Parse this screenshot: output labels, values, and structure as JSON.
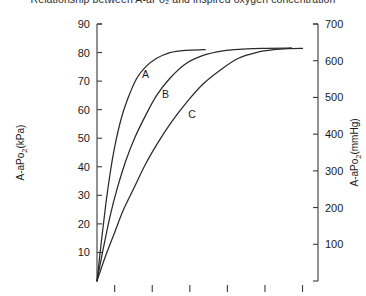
{
  "chart_data": {
    "type": "line",
    "title": "Relationship between A-aPo₂ and inspired oxygen concentration",
    "xlabel": "",
    "ylabel": "A-aPo₂(kPa)",
    "y2label": "A-aPo₂(mmHg)",
    "ylim": [
      0,
      90
    ],
    "y2lim": [
      0,
      700
    ],
    "xlim": [
      0,
      100
    ],
    "grid": false,
    "legend": "inline-curve-labels",
    "y_ticks": [
      10,
      20,
      30,
      40,
      50,
      60,
      70,
      80,
      90
    ],
    "y_tick_labels": [
      "10",
      "20",
      "30",
      "40",
      "50",
      "60",
      "70",
      "80",
      "90"
    ],
    "y2_ticks": [
      100,
      200,
      300,
      400,
      500,
      600,
      700
    ],
    "y2_tick_labels": [
      "100",
      "200",
      "300",
      "400",
      "500",
      "600",
      "700"
    ],
    "x_ticks": [
      8,
      25,
      42,
      59,
      76,
      93
    ],
    "x_tick_labels": [
      "",
      "",
      "",
      "",
      "",
      ""
    ],
    "series": [
      {
        "name": "A",
        "label": "A",
        "label_x": 22,
        "label_y": 71,
        "points": [
          [
            0,
            0
          ],
          [
            2,
            14
          ],
          [
            4,
            27
          ],
          [
            6,
            38
          ],
          [
            8,
            47
          ],
          [
            11,
            57
          ],
          [
            14,
            64
          ],
          [
            18,
            71
          ],
          [
            22,
            75
          ],
          [
            27,
            78
          ],
          [
            33,
            80
          ],
          [
            40,
            80.8
          ],
          [
            48,
            81
          ],
          [
            49,
            81
          ]
        ]
      },
      {
        "name": "B",
        "label": "B",
        "label_x": 31,
        "label_y": 64,
        "points": [
          [
            0,
            0
          ],
          [
            3,
            12
          ],
          [
            6,
            23
          ],
          [
            9,
            32
          ],
          [
            13,
            42
          ],
          [
            17,
            50
          ],
          [
            22,
            58
          ],
          [
            27,
            65
          ],
          [
            33,
            71
          ],
          [
            40,
            76
          ],
          [
            48,
            79
          ],
          [
            57,
            80.6
          ],
          [
            66,
            81.2
          ],
          [
            75,
            81.5
          ],
          [
            88,
            81.6
          ]
        ]
      },
      {
        "name": "C",
        "label": "C",
        "label_x": 43,
        "label_y": 57,
        "points": [
          [
            0,
            0
          ],
          [
            4,
            9
          ],
          [
            8,
            17
          ],
          [
            12,
            25
          ],
          [
            17,
            33
          ],
          [
            22,
            41
          ],
          [
            28,
            49
          ],
          [
            34,
            56
          ],
          [
            41,
            63
          ],
          [
            48,
            69
          ],
          [
            56,
            74
          ],
          [
            64,
            78
          ],
          [
            72,
            80
          ],
          [
            80,
            81
          ],
          [
            88,
            81.4
          ],
          [
            93,
            81.5
          ]
        ]
      }
    ]
  },
  "axes": {
    "left_title": "A-aPo₂(kPa)",
    "right_title": "A-aPo₂(mmHg)"
  },
  "colors": {
    "curve": "#2a2a2a",
    "axis": "#3a3a3a",
    "text": "#1a1a1a",
    "background": "#ffffff"
  }
}
